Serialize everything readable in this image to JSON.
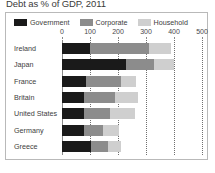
{
  "title": "Debt as % of GDP, 2011",
  "legend": {
    "position": "top",
    "items": [
      {
        "label": "Government",
        "color": "#1a1a1a",
        "key": "government"
      },
      {
        "label": "Corporate",
        "color": "#8c8c8c",
        "key": "corporate"
      },
      {
        "label": "Household",
        "color": "#cfcfcf",
        "key": "household"
      }
    ]
  },
  "chart_data": {
    "type": "bar",
    "orientation": "horizontal",
    "stacked": true,
    "title": "Debt as % of GDP, 2011",
    "xlabel": "",
    "ylabel": "",
    "xlim": [
      0,
      500
    ],
    "xticks": [
      0,
      100,
      200,
      300,
      400,
      500
    ],
    "tick_labels": [
      "0",
      "100",
      "200",
      "300",
      "400",
      "500"
    ],
    "grid": "vertical-dotted",
    "legend_position": "top",
    "categories": [
      "Ireland",
      "Japan",
      "France",
      "Britain",
      "United States",
      "Germany",
      "Greece"
    ],
    "series": [
      {
        "name": "Government",
        "color": "#1a1a1a",
        "values": [
          100,
          230,
          85,
          80,
          80,
          80,
          105
        ]
      },
      {
        "name": "Corporate",
        "color": "#8c8c8c",
        "values": [
          210,
          100,
          125,
          110,
          90,
          65,
          60
        ]
      },
      {
        "name": "Household",
        "color": "#cfcfcf",
        "values": [
          80,
          70,
          55,
          80,
          90,
          60,
          45
        ]
      }
    ],
    "totals": [
      390,
      400,
      265,
      270,
      260,
      205,
      210
    ]
  }
}
